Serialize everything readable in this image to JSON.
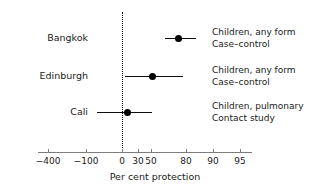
{
  "chart_data": {
    "type": "scatter",
    "title": "",
    "xlabel": "Per cent protection",
    "ylabel": "",
    "grid": false,
    "legend": null,
    "reference_line": {
      "value": 0,
      "style": "dotted",
      "label": "0"
    },
    "xticks": [
      -400,
      -100,
      0,
      30,
      50,
      80,
      90,
      95
    ],
    "xtick_labels": [
      "−400",
      "−100",
      "0",
      "30",
      "50",
      "80",
      "90",
      "95"
    ],
    "xtick_px": [
      48,
      86,
      122,
      138,
      151,
      186,
      213,
      240
    ],
    "axis_px": {
      "left": 38,
      "right": 252,
      "y": 152
    },
    "xlim": [
      -600,
      97
    ],
    "note": "non-linear (log-odds style) protection scale",
    "categories": [
      "Bangkok",
      "Edinburgh",
      "Cali"
    ],
    "series": [
      {
        "name": "Per cent protection",
        "points": [
          {
            "category": "Bangkok",
            "estimate": 72,
            "ci_low": 62,
            "ci_high": 80,
            "row_y_px": 38,
            "estimate_px": 178,
            "ci_low_px": 165,
            "ci_high_px": 196,
            "annotation": [
              "Children, any form",
              "Case–control"
            ]
          },
          {
            "category": "Edinburgh",
            "estimate": 50,
            "ci_low": 28,
            "ci_high": 72,
            "row_y_px": 76,
            "estimate_px": 152,
            "ci_low_px": 125,
            "ci_high_px": 183,
            "annotation": [
              "Children, any form",
              "Case–control"
            ]
          },
          {
            "category": "Cali",
            "estimate": 14,
            "ci_low": -70,
            "ci_high": 52,
            "row_y_px": 112,
            "estimate_px": 127,
            "ci_low_px": 97,
            "ci_high_px": 152,
            "annotation": [
              "Children, pulmonary",
              "Contact study"
            ]
          }
        ]
      }
    ]
  },
  "rows": [
    {
      "label": "Bangkok",
      "annotation_line_1": "Children, any form",
      "annotation_line_2": "Case–control"
    },
    {
      "label": "Edinburgh",
      "annotation_line_1": "Children, any form",
      "annotation_line_2": "Case–control"
    },
    {
      "label": "Cali",
      "annotation_line_1": "Children, pulmonary",
      "annotation_line_2": "Contact study"
    }
  ],
  "axis": {
    "title": "Per cent protection",
    "tick_labels": [
      "−400",
      "−100",
      "0",
      "30",
      "50",
      "80",
      "90",
      "95"
    ]
  },
  "colors": {
    "marker": "#000000",
    "ci_line": "#0d0d0d",
    "axis": "#7d7d7d",
    "reference_line": "#000000",
    "text": "#1a1a1a",
    "background": "#ffffff"
  }
}
